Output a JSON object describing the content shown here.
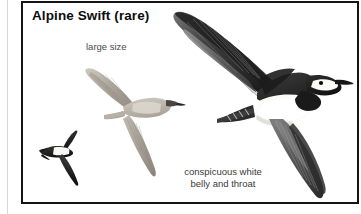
{
  "plate": {
    "title": "Alpine Swift (rare)",
    "frame_color": "#141414",
    "background_color": "#ffffff"
  },
  "annotations": {
    "large_size": "large size",
    "white_belly_line1": "conspicuous white",
    "white_belly_line2": "belly and throat",
    "text_color": "#3a3a3a"
  },
  "illustrations": [
    {
      "name": "common-swift-small-silhouette",
      "description": "small dark swift in flight with white throat band",
      "body_color": "#2b2b2b",
      "accent_color": "#ffffff"
    },
    {
      "name": "alpine-swift-pale-upper",
      "description": "pale tan-grey alpine swift in flight, upper figure",
      "body_color": "#b5b0a6",
      "accent_color": "#8e887e"
    },
    {
      "name": "alpine-swift-large",
      "description": "large alpine swift in flight showing conspicuous white belly and white throat",
      "body_color": "#4a4a4a",
      "accent_color": "#ffffff",
      "dark_color": "#1d1d1d"
    }
  ]
}
